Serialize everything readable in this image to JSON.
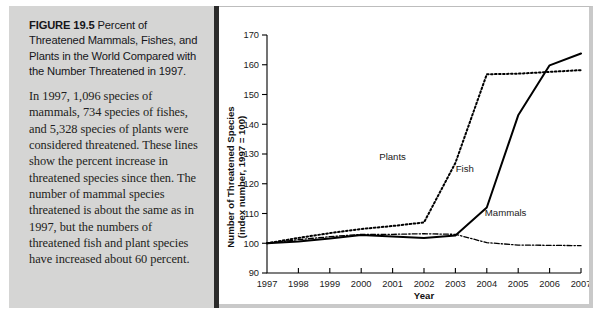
{
  "caption": {
    "figure_label": "FIGURE 19.5",
    "heading": "Percent of Threatened Mammals, Fishes, and Plants in the World Compared with the Number Threatened in 1997.",
    "body": "In 1997, 1,096 species of mammals, 734 species of fishes, and 5,328 species of plants were considered threatened. These lines show the percent increase in threatened species since then. The number of mammal species threatened is about the same as in 1997, but the numbers of threatened fish and plant species have increased about 60 percent."
  },
  "colors": {
    "caption_panel": "#d5d5d4",
    "divider": "#2b2b2b",
    "chart_background": "#ffffff",
    "line": "#000000",
    "panel_shadow": "#c9c9c9"
  },
  "chart_data": {
    "type": "line",
    "title": "",
    "xlabel": "Year",
    "ylabel": "Number of Threatened Species (index number, 1997 = 100)",
    "ylabel_line1": "Number of Threatened Species",
    "ylabel_line2": "(index number, 1997 = 100)",
    "x": [
      1997,
      1998,
      1999,
      2000,
      2001,
      2002,
      2003,
      2004,
      2005,
      2006,
      2007
    ],
    "xtick_labels": [
      "1997",
      "1998",
      "1999",
      "2000",
      "2001",
      "2002",
      "2003",
      "2004",
      "2005",
      "2006",
      "2007"
    ],
    "ytick_labels": [
      "90",
      "100",
      "110",
      "120",
      "130",
      "140",
      "150",
      "160",
      "170"
    ],
    "yticks": [
      90,
      100,
      110,
      120,
      130,
      140,
      150,
      160,
      170
    ],
    "xlim": [
      1997,
      2007
    ],
    "ylim": [
      90,
      170
    ],
    "grid": false,
    "legend": "inline-labels",
    "series": [
      {
        "name": "Plants",
        "style": "dotted",
        "label_x": 2001.0,
        "label_y": 128,
        "values": [
          100.0,
          101.8,
          103.4,
          104.8,
          105.8,
          107.0,
          127.0,
          156.8,
          157.0,
          157.6,
          158.2
        ]
      },
      {
        "name": "Fish",
        "style": "solid",
        "label_x": 2003.3,
        "label_y": 124,
        "values": [
          100.0,
          100.6,
          101.6,
          102.8,
          102.3,
          101.8,
          102.6,
          112.0,
          143.0,
          159.8,
          163.8
        ]
      },
      {
        "name": "Mammals",
        "style": "dash-dot",
        "label_x": 2004.6,
        "label_y": 109,
        "values": [
          100.0,
          101.2,
          102.2,
          103.0,
          103.0,
          103.2,
          103.0,
          100.2,
          99.4,
          99.3,
          99.2
        ]
      }
    ]
  }
}
